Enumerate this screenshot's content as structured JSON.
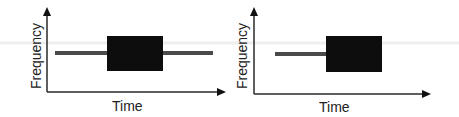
{
  "diagrams": [
    {
      "name": "left",
      "xlabel": "Time",
      "ylabel": "Frequency",
      "tone_line": {
        "x1": 55,
        "x2": 213,
        "y": 53,
        "color": "#4a4a4a"
      },
      "burst_box": {
        "x": 107,
        "y": 36,
        "w": 56,
        "h": 35,
        "color": "#0d0d0d"
      }
    },
    {
      "name": "right",
      "xlabel": "Time",
      "ylabel": "Frequency",
      "tone_line": {
        "x1": 275,
        "x2": 326,
        "y": 53,
        "color": "#4a4a4a"
      },
      "burst_box": {
        "x": 326,
        "y": 36,
        "w": 56,
        "h": 36,
        "color": "#0d0d0d"
      }
    }
  ],
  "colors": {
    "axis": "#2a2a2a",
    "line": "#4a4a4a",
    "box": "#0d0d0d",
    "text": "#222222"
  }
}
